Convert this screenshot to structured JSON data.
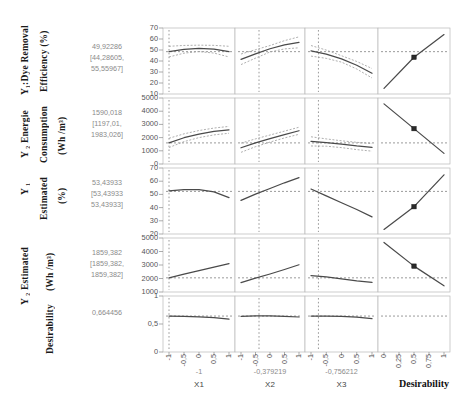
{
  "figure": {
    "colors": {
      "line": "#4a4a4a",
      "ci": "#9a9a9a",
      "ref": "#8f8f8f",
      "panel_border": "#b8b8b8",
      "text_grey": "#8a8a8a"
    }
  },
  "rows": [
    {
      "id": "y1-dye-removal",
      "label_outer": "Y₁:Dye Removal",
      "label_inner": "Efficiency (%)",
      "value": "49,92286",
      "ci_low": "[44,28605,",
      "ci_high": "55,55967]",
      "yticks": [
        "70",
        "60",
        "50",
        "40",
        "30",
        "20",
        "10"
      ],
      "ylim": [
        5,
        75
      ]
    },
    {
      "id": "y2-energie-consumption",
      "label_outer": "Y ₂ Energie",
      "label_inner": "Consumption",
      "label_unit": "(Wh /m³)",
      "value": "1590,018",
      "ci_low": "[1197,01,",
      "ci_high": "1983,026]",
      "yticks": [
        "5000",
        "4000",
        "3000",
        "2000",
        "1000",
        "0"
      ],
      "ylim": [
        -200,
        5400
      ]
    },
    {
      "id": "y1-estimated",
      "label_outer": "Y ₁",
      "label_inner": "Estimated",
      "label_unit": "(%)",
      "value": "53,43933",
      "ci_low": "[53,43933",
      "ci_high": "53,43933]",
      "yticks": [
        "70",
        "60",
        "50",
        "40",
        "30",
        "20"
      ],
      "ylim": [
        16,
        74
      ]
    },
    {
      "id": "y2-estimated",
      "label_outer": "Y ₂ Estimated",
      "label_inner": "(Wh /m³)",
      "value": "1859,382",
      "ci_low": "[1859,382,",
      "ci_high": "1859,382]",
      "yticks": [
        "5000",
        "4000",
        "3000",
        "2000",
        "1000"
      ],
      "ylim": [
        600,
        5400
      ]
    },
    {
      "id": "desirability",
      "label_outer": "Desirability",
      "value": "0,664456",
      "yticks": [
        "1",
        "0,5",
        "0"
      ],
      "ylim": [
        -0.08,
        1.08
      ]
    }
  ],
  "factors": [
    {
      "name": "X1",
      "current": "-1",
      "ticks": [
        "-1",
        "-0,5",
        "0",
        "0,5",
        "1"
      ],
      "lim": [
        -1,
        1
      ]
    },
    {
      "name": "X2",
      "current": "-0,379219",
      "ticks": [
        "-1",
        "-0,5",
        "0",
        "0,5",
        "1"
      ],
      "lim": [
        -1,
        1
      ]
    },
    {
      "name": "X3",
      "current": "-0,756212",
      "ticks": [
        "-1",
        "-0,5",
        "0",
        "0,5",
        "1"
      ],
      "lim": [
        -1,
        1
      ]
    },
    {
      "name": "Desirability",
      "current": "",
      "ticks": [
        "0",
        "0,25",
        "0,5",
        "0,75",
        "1"
      ],
      "lim": [
        0,
        1
      ]
    }
  ],
  "chart_data": {
    "type": "line",
    "xlabel": "X1 / X2 / X3 / Desirability",
    "ylabel": "Response",
    "grid": false,
    "legend": "none",
    "current_factor_settings": {
      "X1": -1,
      "X2": -0.379219,
      "X3": -0.756212
    },
    "current_responses": {
      "Y1_dye_removal_efficiency_pct": 49.92286,
      "Y1_ci": [
        44.28605,
        55.55967
      ],
      "Y2_energie_consumption_Wh_m3": 1590.018,
      "Y2_ci": [
        1197.01,
        1983.026
      ],
      "Y1_estimated_pct": 53.43933,
      "Y1_estimated_ci": [
        53.43933,
        53.43933
      ],
      "Y2_estimated_Wh_m3": 1859.382,
      "Y2_estimated_ci": [
        1859.382,
        1859.382
      ],
      "desirability": 0.664456
    },
    "panels": [
      {
        "row": "Y1:Dye Removal Efficiency (%)",
        "ylim": [
          5,
          75
        ],
        "traces": [
          {
            "factor": "X1",
            "x": [
              -1,
              -0.5,
              0,
              0.5,
              1
            ],
            "y": [
              49.9,
              52.4,
              53.4,
              52.5,
              49.9
            ],
            "ci_upper": [
              55.6,
              56.5,
              56.8,
              56.6,
              55.6
            ],
            "ci_lower": [
              44.3,
              48.3,
              50.0,
              48.4,
              44.3
            ]
          },
          {
            "factor": "X2",
            "x": [
              -1,
              -0.5,
              0,
              0.5,
              1
            ],
            "y": [
              41.8,
              47.5,
              53.0,
              57.2,
              59.8
            ],
            "ci_upper": [
              47.4,
              52.0,
              56.4,
              61.6,
              65.6
            ],
            "ci_lower": [
              36.2,
              43.0,
              49.6,
              52.8,
              54.0
            ]
          },
          {
            "factor": "X3",
            "x": [
              -1,
              -0.5,
              0,
              0.5,
              1
            ],
            "y": [
              50.8,
              47.2,
              42.2,
              35.5,
              27.0
            ],
            "ci_upper": [
              56.4,
              51.6,
              45.6,
              39.5,
              32.0
            ],
            "ci_lower": [
              45.2,
              42.8,
              38.8,
              31.5,
              22.0
            ]
          },
          {
            "factor": "Desirability",
            "x": [
              0,
              0.5,
              1
            ],
            "y": [
              11.0,
              44.0,
              68.0
            ],
            "marker_at": 0.5
          }
        ],
        "reference_line": 49.92286
      },
      {
        "row": "Y2 Energie Consumption (Wh/m3)",
        "ylim": [
          -200,
          5400
        ],
        "traces": [
          {
            "factor": "X1",
            "x": [
              -1,
              -0.5,
              0,
              0.5,
              1
            ],
            "y": [
              1590,
              2030,
              2340,
              2560,
              2700
            ],
            "ci_upper": [
              1983,
              2360,
              2640,
              2850,
              2990
            ],
            "ci_lower": [
              1197,
              1700,
              2040,
              2270,
              2410
            ]
          },
          {
            "factor": "X2",
            "x": [
              -1,
              -0.5,
              0,
              0.5,
              1
            ],
            "y": [
              1180,
              1600,
              1960,
              2300,
              2620
            ],
            "ci_upper": [
              1570,
              1930,
              2260,
              2590,
              2920
            ],
            "ci_lower": [
              790,
              1270,
              1660,
              2010,
              2320
            ]
          },
          {
            "factor": "X3",
            "x": [
              -1,
              -0.5,
              0,
              0.5,
              1
            ],
            "y": [
              1720,
              1620,
              1480,
              1330,
              1210
            ],
            "ci_upper": [
              2110,
              1930,
              1770,
              1640,
              1530
            ],
            "ci_lower": [
              1330,
              1310,
              1190,
              1020,
              890
            ]
          },
          {
            "factor": "Desirability",
            "x": [
              0,
              0.5,
              1
            ],
            "y": [
              4900,
              2800,
              700
            ],
            "marker_at": 0.5
          }
        ],
        "reference_line": 1590.018
      },
      {
        "row": "Y1 Estimated (%)",
        "ylim": [
          16,
          74
        ],
        "traces": [
          {
            "factor": "X1",
            "x": [
              -1,
              -0.5,
              0,
              0.5,
              1
            ],
            "y": [
              54.0,
              55.0,
              55.0,
              53.0,
              48.0
            ]
          },
          {
            "factor": "X2",
            "x": [
              -1,
              -0.5,
              0,
              0.5,
              1
            ],
            "y": [
              45.5,
              51.0,
              56.0,
              61.0,
              65.5
            ]
          },
          {
            "factor": "X3",
            "x": [
              -1,
              -0.5,
              0,
              0.5,
              1
            ],
            "y": [
              55.5,
              49.5,
              43.5,
              37.5,
              31.0
            ]
          },
          {
            "factor": "Desirability",
            "x": [
              0,
              0.5,
              1
            ],
            "y": [
              20.0,
              40.0,
              68.0
            ],
            "marker_at": 0.5
          }
        ],
        "reference_line": 53.43933
      },
      {
        "row": "Y2 Estimated (Wh/m3)",
        "ylim": [
          600,
          5400
        ],
        "traces": [
          {
            "factor": "X1",
            "x": [
              -1,
              -0.5,
              0,
              0.5,
              1
            ],
            "y": [
              1860,
              2180,
              2500,
              2820,
              3120
            ]
          },
          {
            "factor": "X2",
            "x": [
              -1,
              -0.5,
              0,
              0.5,
              1
            ],
            "y": [
              1430,
              1830,
              2200,
              2600,
              3020
            ]
          },
          {
            "factor": "X3",
            "x": [
              -1,
              -0.5,
              0,
              0.5,
              1
            ],
            "y": [
              2060,
              1950,
              1760,
              1580,
              1450
            ]
          },
          {
            "factor": "Desirability",
            "x": [
              0,
              0.5,
              1
            ],
            "y": [
              5000,
              2900,
              1150
            ],
            "marker_at": 0.5
          }
        ],
        "reference_line": 1859.382
      },
      {
        "row": "Desirability",
        "ylim": [
          -0.08,
          1.08
        ],
        "traces": [
          {
            "factor": "X1",
            "x": [
              -1,
              -0.5,
              0,
              0.5,
              1
            ],
            "y": [
              0.664,
              0.66,
              0.65,
              0.63,
              0.6
            ]
          },
          {
            "factor": "X2",
            "x": [
              -1,
              -0.5,
              0,
              0.5,
              1
            ],
            "y": [
              0.66,
              0.668,
              0.668,
              0.66,
              0.645
            ]
          },
          {
            "factor": "X3",
            "x": [
              -1,
              -0.5,
              0,
              0.5,
              1
            ],
            "y": [
              0.664,
              0.665,
              0.658,
              0.64,
              0.612
            ]
          },
          {
            "factor": "Desirability",
            "x": [],
            "y": []
          }
        ],
        "reference_line": 0.664456
      }
    ]
  }
}
